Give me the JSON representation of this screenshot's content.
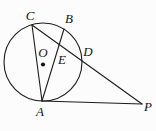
{
  "figure": {
    "background_color": "#fcfcfc",
    "stroke_color": "#1c1c1c",
    "labels": {
      "C": "C",
      "B": "B",
      "O": "O",
      "E": "E",
      "D": "D",
      "A": "A",
      "P": "P"
    }
  }
}
